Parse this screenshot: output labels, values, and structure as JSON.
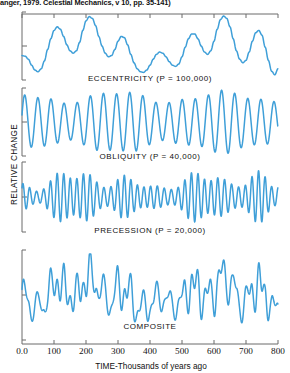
{
  "caption": "anger, 1979. Celestial Mechanics, v 10, pp. 35-141)",
  "axes": {
    "ylabel": "RELATIVE CHANGE",
    "xlabel": "TIME-Thousands of years ago",
    "xticks": [
      "0.0",
      "100",
      "200",
      "300",
      "400",
      "500",
      "600",
      "700",
      "800"
    ]
  },
  "panels": [
    {
      "label": "ECCENTRICITY (P = 100,000)"
    },
    {
      "label": "OBLIQUITY (P = 40,000)"
    },
    {
      "label": "PRECESSION (P = 20,000)"
    },
    {
      "label": "COMPOSITE"
    }
  ],
  "colors": {
    "line": "#3f9fd8",
    "axis": "#6b6b6b",
    "text": "#111111"
  },
  "chart_data": {
    "type": "line",
    "title": "",
    "xlabel": "TIME-Thousands of years ago",
    "ylabel": "RELATIVE CHANGE",
    "xlim": [
      0,
      800
    ],
    "grid": false,
    "legend": "none",
    "subplots": [
      {
        "name": "eccentricity",
        "label": "ECCENTRICITY (P = 100,000)",
        "period_years": 100000,
        "x": [
          0,
          10,
          20,
          30,
          40,
          50,
          60,
          70,
          80,
          90,
          100,
          110,
          120,
          130,
          140,
          150,
          160,
          170,
          180,
          190,
          200,
          210,
          220,
          230,
          240,
          250,
          260,
          270,
          280,
          290,
          300,
          310,
          320,
          330,
          340,
          350,
          360,
          370,
          380,
          390,
          400,
          410,
          420,
          430,
          440,
          450,
          460,
          470,
          480,
          490,
          500,
          510,
          520,
          530,
          540,
          550,
          560,
          570,
          580,
          590,
          600,
          610,
          620,
          630,
          640,
          650,
          660,
          670,
          680,
          690,
          700,
          710,
          720,
          730,
          740,
          750,
          760,
          770,
          780,
          790,
          800
        ],
        "y": [
          0.34,
          0.33,
          0.28,
          0.18,
          0.1,
          0.07,
          0.12,
          0.25,
          0.44,
          0.62,
          0.76,
          0.82,
          0.78,
          0.66,
          0.52,
          0.42,
          0.38,
          0.42,
          0.56,
          0.76,
          0.92,
          0.99,
          0.96,
          0.84,
          0.66,
          0.5,
          0.38,
          0.32,
          0.34,
          0.44,
          0.58,
          0.66,
          0.64,
          0.52,
          0.36,
          0.22,
          0.12,
          0.07,
          0.06,
          0.1,
          0.18,
          0.28,
          0.36,
          0.4,
          0.38,
          0.32,
          0.24,
          0.18,
          0.16,
          0.2,
          0.32,
          0.48,
          0.62,
          0.7,
          0.7,
          0.62,
          0.5,
          0.4,
          0.36,
          0.42,
          0.58,
          0.78,
          0.94,
          1.0,
          0.96,
          0.82,
          0.62,
          0.42,
          0.28,
          0.22,
          0.26,
          0.4,
          0.58,
          0.72,
          0.76,
          0.68,
          0.48,
          0.26,
          0.08,
          0.02,
          0.12
        ]
      },
      {
        "name": "obliquity",
        "label": "OBLIQUITY (P = 40,000)",
        "period_years": 40000,
        "amplitude_modulation": true
      },
      {
        "name": "precession",
        "label": "PRECESSION (P = 20,000)",
        "period_years": 20000,
        "amplitude_modulation": true
      },
      {
        "name": "composite",
        "label": "COMPOSITE",
        "description": "sum of eccentricity, obliquity and precession curves"
      }
    ]
  }
}
